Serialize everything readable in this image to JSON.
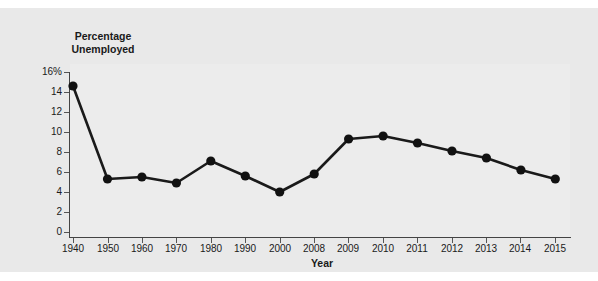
{
  "figure": {
    "partial_caption_top": "",
    "background_color": "#e9e9e9"
  },
  "axes": {
    "y_title_line1": "Percentage",
    "y_title_line2": "Unemployed",
    "x_title": "Year",
    "y_ticks": [
      "16%",
      "14",
      "12",
      "10",
      "8",
      "6",
      "4",
      "2",
      "0"
    ],
    "y_tick_values": [
      16,
      14,
      12,
      10,
      8,
      6,
      4,
      2,
      0
    ],
    "x_ticks": [
      "1940",
      "1950",
      "1960",
      "1970",
      "1980",
      "1990",
      "2000",
      "2008",
      "2009",
      "2010",
      "2011",
      "2012",
      "2013",
      "2014",
      "2015"
    ]
  },
  "style": {
    "line_color": "#1a1a1a",
    "marker_color": "#111111",
    "axis_color": "#444444",
    "text_color": "#1a1a1a"
  },
  "chart_data": {
    "type": "line",
    "title": "",
    "xlabel": "Year",
    "ylabel": "Percentage Unemployed",
    "categories": [
      "1940",
      "1950",
      "1960",
      "1970",
      "1980",
      "1990",
      "2000",
      "2008",
      "2009",
      "2010",
      "2011",
      "2012",
      "2013",
      "2014",
      "2015"
    ],
    "values": [
      14.6,
      5.3,
      5.5,
      4.9,
      7.1,
      5.6,
      4.0,
      5.8,
      9.3,
      9.6,
      8.9,
      8.1,
      7.4,
      6.2,
      5.3
    ],
    "x": [
      1940,
      1950,
      1960,
      1970,
      1980,
      1990,
      2000,
      2008,
      2009,
      2010,
      2011,
      2012,
      2013,
      2014,
      2015
    ],
    "ylim": [
      0,
      16
    ],
    "ytick_step": 2,
    "grid": false,
    "legend": "none",
    "markers": "filled-circle",
    "note": "Categorical x-axis with equal spacing; decade samples 1940-2000 then annual 2008-2015"
  }
}
